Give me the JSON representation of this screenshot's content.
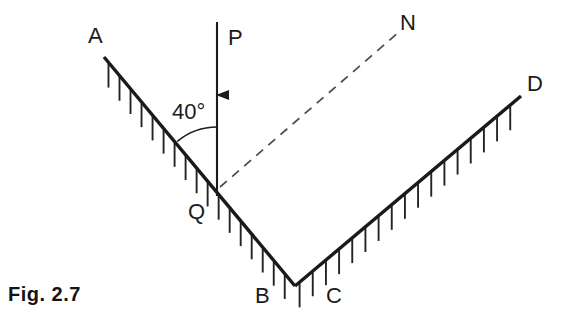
{
  "figure": {
    "caption": "Fig. 2.7",
    "type": "physics-free-body-diagram"
  },
  "colors": {
    "ink": "#1b1b1b",
    "surface_line": "#1a1a1a",
    "hatch_line": "#232323",
    "dashed_line": "#4a4a4a",
    "background": "#ffffff"
  },
  "labels": {
    "a": "A",
    "p": "P",
    "n": "N",
    "d": "D",
    "q": "Q",
    "b": "B",
    "c": "C",
    "angle": "40°"
  },
  "geometry": {
    "surface_ab": {
      "x1": 104,
      "y1": 57,
      "x2": 295,
      "y2": 286
    },
    "surface_cd": {
      "x1": 295,
      "y1": 286,
      "x2": 521,
      "y2": 96
    },
    "load_line": {
      "x": 217,
      "y1": 22,
      "y2": 196
    },
    "arrow_tip_y": 95,
    "normal_dashed": {
      "x1": 220,
      "y1": 187,
      "x2": 399,
      "y2": 32
    },
    "vertex_q": {
      "x": 217,
      "y": 189
    },
    "vertex_bc": {
      "x": 295,
      "y": 286
    },
    "angle_value_degrees": 40
  },
  "label_positions": {
    "a": {
      "left": 88,
      "top": 25
    },
    "p": {
      "left": 228,
      "top": 27
    },
    "n": {
      "left": 400,
      "top": 12
    },
    "d": {
      "left": 527,
      "top": 73
    },
    "q": {
      "left": 188,
      "top": 201
    },
    "b": {
      "left": 255,
      "top": 285
    },
    "c": {
      "left": 326,
      "top": 285
    },
    "angle": {
      "left": 172,
      "top": 101
    },
    "caption": {
      "left": 8,
      "top": 283
    }
  }
}
